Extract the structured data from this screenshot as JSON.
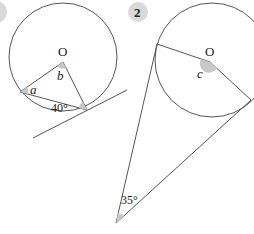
{
  "figure_1": {
    "badge": "1",
    "center_label": "O",
    "angle_a_label": "a",
    "angle_b_label": "b",
    "given_angle_label": "40°"
  },
  "figure_2": {
    "badge": "2",
    "center_label": "O",
    "angle_c_label": "c",
    "given_angle_label": "35°"
  },
  "colors": {
    "line": "#555555",
    "shade": "#c8c8c8",
    "badge_bg": "#d9d9d9"
  }
}
